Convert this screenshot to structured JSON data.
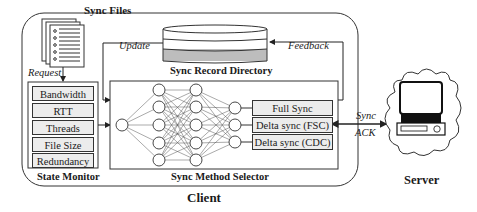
{
  "diagram": {
    "client": {
      "label": "Client",
      "sync_files": {
        "label": "Sync Files",
        "icon": "document-stack-icon"
      },
      "request_label": "Request",
      "update_label": "Update",
      "feedback_label": "Feedback",
      "sync_record_directory": {
        "label": "Sync Record Directory",
        "icon": "database-cylinder-icon"
      },
      "state_monitor": {
        "label": "State Monitor",
        "items": [
          "Bandwidth",
          "RTT",
          "Threads",
          "File Size",
          "Redundancy"
        ]
      },
      "sync_method_selector": {
        "label": "Sync Method Selector",
        "neural_network": {
          "layers": [
            1,
            5,
            5,
            3
          ]
        },
        "methods": [
          "Full Sync",
          "Delta sync (FSC)",
          "Delta sync (CDC)"
        ]
      }
    },
    "link": {
      "sync_label": "Sync",
      "ack_label": "ACK"
    },
    "server": {
      "label": "Server",
      "icon": "computer-cloud-icon"
    }
  }
}
